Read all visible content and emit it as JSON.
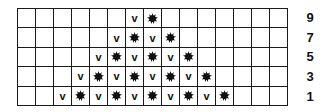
{
  "chart": {
    "title": "",
    "columns": 15,
    "legend": {
      "v": "slip-stitch-v",
      "b": "bobble-burst"
    },
    "rows": [
      {
        "label": "9",
        "cells": [
          "",
          "",
          "",
          "",
          "",
          "",
          "v",
          "b",
          "",
          "",
          "",
          "",
          "",
          "",
          ""
        ]
      },
      {
        "label": "7",
        "cells": [
          "",
          "",
          "",
          "",
          "",
          "v",
          "b",
          "v",
          "b",
          "",
          "",
          "",
          "",
          "",
          ""
        ]
      },
      {
        "label": "5",
        "cells": [
          "",
          "",
          "",
          "",
          "v",
          "b",
          "v",
          "b",
          "v",
          "b",
          "",
          "",
          "",
          "",
          ""
        ]
      },
      {
        "label": "3",
        "cells": [
          "",
          "",
          "",
          "v",
          "b",
          "v",
          "b",
          "v",
          "b",
          "v",
          "b",
          "",
          "",
          "",
          ""
        ]
      },
      {
        "label": "1",
        "cells": [
          "",
          "",
          "v",
          "b",
          "v",
          "b",
          "v",
          "b",
          "v",
          "b",
          "v",
          "b",
          "",
          "",
          ""
        ]
      }
    ],
    "symbols": {
      "v_text": "v"
    }
  }
}
